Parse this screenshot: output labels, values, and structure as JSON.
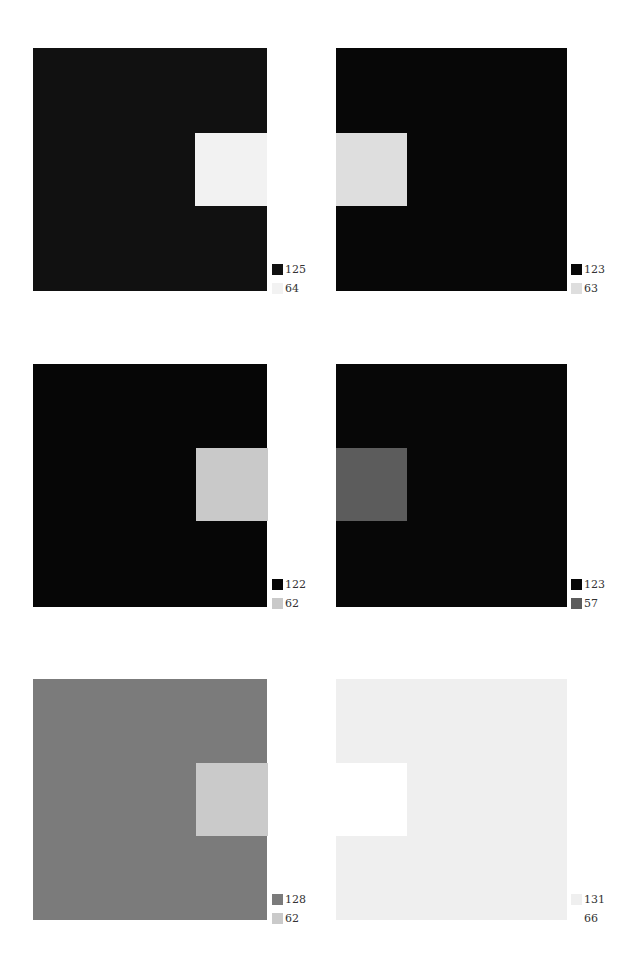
{
  "panels": [
    {
      "id": "top-left",
      "background_color": "#111111",
      "inner_color": "#f2f2f2",
      "inner_side": "right",
      "legend": [
        {
          "swatch_color": "#111111",
          "value": "125"
        },
        {
          "swatch_color": "#f2f2f2",
          "value": "64"
        }
      ]
    },
    {
      "id": "top-right",
      "background_color": "#070707",
      "inner_color": "#dedede",
      "inner_side": "left",
      "legend": [
        {
          "swatch_color": "#070707",
          "value": "123"
        },
        {
          "swatch_color": "#dedede",
          "value": "63"
        }
      ]
    },
    {
      "id": "middle-left",
      "background_color": "#060606",
      "inner_color": "#c9c9c9",
      "inner_side": "right",
      "legend": [
        {
          "swatch_color": "#060606",
          "value": "122"
        },
        {
          "swatch_color": "#c9c9c9",
          "value": "62"
        }
      ]
    },
    {
      "id": "middle-right",
      "background_color": "#070707",
      "inner_color": "#5c5c5c",
      "inner_side": "left",
      "legend": [
        {
          "swatch_color": "#070707",
          "value": "123"
        },
        {
          "swatch_color": "#5c5c5c",
          "value": "57"
        }
      ]
    },
    {
      "id": "bottom-left",
      "background_color": "#7b7b7b",
      "inner_color": "#cacaca",
      "inner_side": "right",
      "legend": [
        {
          "swatch_color": "#7b7b7b",
          "value": "128"
        },
        {
          "swatch_color": "#cacaca",
          "value": "62"
        }
      ]
    },
    {
      "id": "bottom-right",
      "background_color": "#efefef",
      "inner_color": "#ffffff",
      "inner_side": "left",
      "legend": [
        {
          "swatch_color": "#efefef",
          "value": "131"
        },
        {
          "swatch_color": "#ffffff",
          "value": "66"
        }
      ]
    }
  ]
}
